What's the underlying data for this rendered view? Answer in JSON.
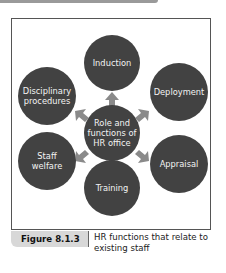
{
  "diagram": {
    "center": {
      "label": "Role and functions of HR office"
    },
    "nodes": [
      {
        "id": "induction",
        "label": "Induction"
      },
      {
        "id": "deployment",
        "label": "Deployment"
      },
      {
        "id": "appraisal",
        "label": "Appraisal"
      },
      {
        "id": "training",
        "label": "Training"
      },
      {
        "id": "staff-welfare",
        "label": "Staff welfare"
      },
      {
        "id": "disciplinary-procedures",
        "label": "Disciplinary procedures"
      }
    ],
    "colors": {
      "circle": "#424242",
      "arrow": "#8a8a8a",
      "text": "#f2f2f2"
    }
  },
  "caption": {
    "figure_label": "Figure 8.1.3",
    "text": "HR functions that relate to existing staff"
  }
}
